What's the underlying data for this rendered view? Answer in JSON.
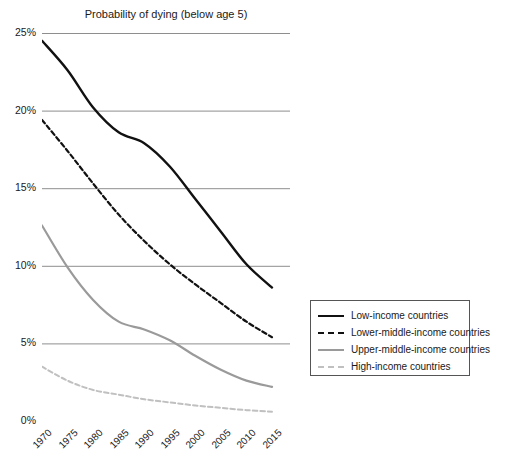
{
  "chart_data": {
    "type": "line",
    "title": "Probability of dying (below age 5)",
    "xlabel": "",
    "ylabel": "",
    "x": [
      1970,
      1975,
      1980,
      1985,
      1990,
      1995,
      2000,
      2005,
      2010,
      2015
    ],
    "xtick_labels": [
      "1970",
      "1975",
      "1980",
      "1985",
      "1990",
      "1995",
      "2000",
      "2005",
      "2010",
      "2015"
    ],
    "ytick_labels": [
      "0%",
      "5%",
      "10%",
      "15%",
      "20%",
      "25%"
    ],
    "ytick_values": [
      0,
      5,
      10,
      15,
      20,
      25
    ],
    "ylim": [
      0,
      25
    ],
    "xlim": [
      1970,
      2015
    ],
    "grid": "horizontal",
    "legend_position": "right",
    "series": [
      {
        "name": "Low-income countries",
        "color": "#111111",
        "style": "solid",
        "width": 2.4,
        "values": [
          24.5,
          22.6,
          20.2,
          18.6,
          17.9,
          16.4,
          14.3,
          12.2,
          10.1,
          8.6
        ]
      },
      {
        "name": "Lower-middle-income countries",
        "color": "#111111",
        "style": "dashed",
        "width": 2.2,
        "values": [
          19.4,
          17.4,
          15.3,
          13.3,
          11.6,
          10.1,
          8.8,
          7.6,
          6.4,
          5.4
        ]
      },
      {
        "name": "Upper-middle-income countries",
        "color": "#9a9a9a",
        "style": "solid",
        "width": 2.2,
        "values": [
          12.6,
          9.9,
          7.8,
          6.4,
          5.9,
          5.2,
          4.2,
          3.3,
          2.6,
          2.2
        ]
      },
      {
        "name": "High-income countries",
        "color": "#c0c0c0",
        "style": "dashed",
        "width": 2.0,
        "values": [
          3.5,
          2.6,
          2.0,
          1.7,
          1.4,
          1.2,
          1.0,
          0.85,
          0.7,
          0.6
        ]
      }
    ]
  },
  "legend": {
    "items": [
      {
        "label": "Low-income countries"
      },
      {
        "label": "Lower-middle-income countries"
      },
      {
        "label": "Upper-middle-income countries"
      },
      {
        "label": "High-income countries"
      }
    ]
  }
}
